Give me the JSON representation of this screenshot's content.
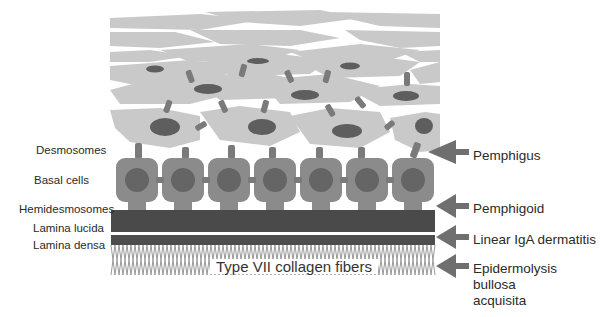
{
  "diagram": {
    "colors": {
      "background": "#ffffff",
      "upper_cell": "#c9c9c9",
      "upper_nucleus": "#5e5e5e",
      "desmosome": "#7a7a7a",
      "basal_cell": "#8b8b8b",
      "basal_nucleus": "#656565",
      "hemidesmosome_band": "#4a4a4a",
      "lamina_densa_band": "#4d4d4d",
      "collagen_fibers": "#9a9a9a",
      "arrow": "#6f6f6f",
      "text": "#2a2a2a"
    },
    "left_labels": [
      {
        "id": "desmosomes",
        "text": "Desmosomes"
      },
      {
        "id": "basal-cells",
        "text": "Basal cells"
      },
      {
        "id": "hemidesmosomes",
        "text": "Hemidesmosomes"
      },
      {
        "id": "lamina-lucida",
        "text": "Lamina lucida"
      },
      {
        "id": "lamina-densa",
        "text": "Lamina densa"
      }
    ],
    "center_label": "Type VII collagen fibers",
    "right_labels": [
      {
        "id": "pemphigus",
        "lines": [
          "Pemphigus"
        ],
        "target": "Desmosomes"
      },
      {
        "id": "pemphigoid",
        "lines": [
          "Pemphigoid"
        ],
        "target": "Hemidesmosomes"
      },
      {
        "id": "linear-iga-dermatitis",
        "lines": [
          "Linear IgA dermatitis"
        ],
        "target": "Lamina densa"
      },
      {
        "id": "epidermolysis-bullosa-acquisita",
        "lines": [
          "Epidermolysis",
          "bullosa",
          "acquisita"
        ],
        "target": "Type VII collagen fibers"
      }
    ],
    "basal_cell_count": 7
  }
}
